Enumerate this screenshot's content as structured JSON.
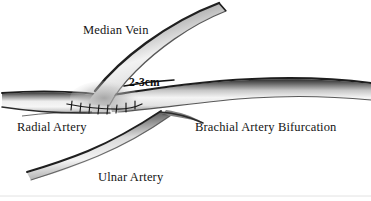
{
  "figure": {
    "background_color": "#ffffff",
    "width": 371,
    "height": 201,
    "ink_color": "#141414",
    "vessel_fill_light": "#f2f2f2",
    "vessel_shadow_dark": "#3b3b3b"
  },
  "labels": {
    "median_vein": "Median Vein",
    "radial_artery": "Radial Artery",
    "brachial_artery_bifurcation": "Brachial Artery Bifurcation",
    "ulnar_artery": "Ulnar Artery",
    "measurement": "2-3cm"
  },
  "structures": [
    {
      "name": "median-vein",
      "label": "Median Vein",
      "description": "Tapered vein tube descending from upper right to the anastomosis site at left of center"
    },
    {
      "name": "radial-artery",
      "label": "Radial Artery",
      "description": "Horizontal vessel entering from the left edge, thinning toward the left margin"
    },
    {
      "name": "brachial-artery",
      "label": "Brachial Artery Bifurcation",
      "description": "Main trunk running to the right edge, darker shading along its superior border"
    },
    {
      "name": "ulnar-artery",
      "label": "Ulnar Artery",
      "description": "Inferior branch sweeping down and to the left from the bifurcation"
    },
    {
      "name": "anastomosis",
      "label": "2-3cm",
      "description": "Sutured junction between median vein and artery, marked with stitch ticks"
    }
  ],
  "annotations": {
    "measurement_value": "2-3cm",
    "suture_count": 8
  }
}
